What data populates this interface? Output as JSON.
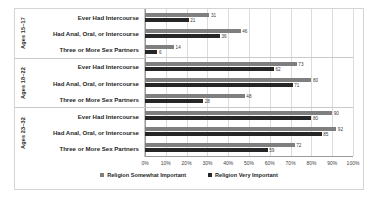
{
  "chart_data": {
    "type": "bar",
    "orientation": "horizontal",
    "title": "",
    "xlabel": "",
    "ylabel": "",
    "xlim": [
      0,
      100
    ],
    "grid": true,
    "legend_position": "bottom",
    "xticks": [
      "0%",
      "10%",
      "20%",
      "30%",
      "40%",
      "50%",
      "60%",
      "70%",
      "80%",
      "90%",
      "100%"
    ],
    "xtick_values": [
      0,
      10,
      20,
      30,
      40,
      50,
      60,
      70,
      80,
      90,
      100
    ],
    "series": [
      {
        "name": "Religion Somewhat Important",
        "color": "#7f7f7f"
      },
      {
        "name": "Religion Very Important",
        "color": "#262626"
      }
    ],
    "groups": [
      {
        "label": "Ages 15–17",
        "categories": [
          {
            "label": "Ever Had Intercourse",
            "somewhat": 31,
            "very": 21
          },
          {
            "label": "Had Anal, Oral, or Intercourse",
            "somewhat": 46,
            "very": 36
          },
          {
            "label": "Three or More Sex Partners",
            "somewhat": 14,
            "very": 6
          }
        ]
      },
      {
        "label": "Ages 18–22",
        "categories": [
          {
            "label": "Ever Had Intercourse",
            "somewhat": 73,
            "very": 62
          },
          {
            "label": "Had Anal, Oral, or Intercourse",
            "somewhat": 80,
            "very": 71
          },
          {
            "label": "Three or More Sex Partners",
            "somewhat": 48,
            "very": 28
          }
        ]
      },
      {
        "label": "Ages 23–32",
        "categories": [
          {
            "label": "Ever Had Intercourse",
            "somewhat": 90,
            "very": 80
          },
          {
            "label": "Had Anal, Oral, or Intercourse",
            "somewhat": 92,
            "very": 85
          },
          {
            "label": "Three or More Sex Partners",
            "somewhat": 72,
            "very": 59
          }
        ]
      }
    ]
  }
}
